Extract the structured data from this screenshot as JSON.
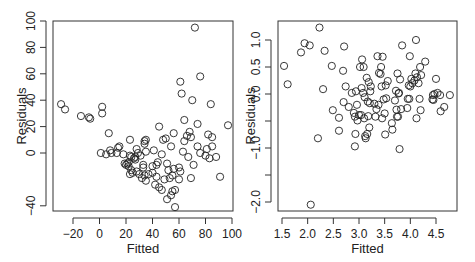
{
  "chart_data": [
    {
      "type": "scatter",
      "title": "",
      "xlabel": "Fitted",
      "ylabel": "Residuals",
      "xlim": [
        -32,
        101
      ],
      "ylim": [
        -45,
        100
      ],
      "xticks": [
        -20,
        0,
        20,
        40,
        60,
        80,
        100
      ],
      "yticks": [
        -40,
        0,
        20,
        40,
        60,
        80,
        100
      ],
      "ytick_labels_shown": [
        "-40",
        "0",
        "20",
        "40",
        "60",
        "80",
        "100"
      ],
      "grid": false,
      "legend": null,
      "points": [
        [
          -29,
          37
        ],
        [
          -26,
          33
        ],
        [
          -14,
          28
        ],
        [
          -8,
          27
        ],
        [
          -7,
          26
        ],
        [
          2,
          35
        ],
        [
          2,
          30
        ],
        [
          7,
          15
        ],
        [
          23,
          10
        ],
        [
          34,
          9
        ],
        [
          35,
          10
        ],
        [
          45,
          20
        ],
        [
          1,
          0
        ],
        [
          5,
          -1
        ],
        [
          8,
          2
        ],
        [
          9,
          0
        ],
        [
          13,
          0
        ],
        [
          14,
          4
        ],
        [
          15,
          5
        ],
        [
          18,
          -1
        ],
        [
          19,
          -8
        ],
        [
          20,
          -9
        ],
        [
          21,
          -8
        ],
        [
          22,
          -7
        ],
        [
          22,
          -10
        ],
        [
          23,
          -16
        ],
        [
          23,
          -2
        ],
        [
          24,
          -3
        ],
        [
          24,
          -13
        ],
        [
          25,
          -15
        ],
        [
          26,
          -4
        ],
        [
          27,
          -5
        ],
        [
          27,
          -3
        ],
        [
          28,
          -14
        ],
        [
          28,
          3
        ],
        [
          29,
          0
        ],
        [
          30,
          -16
        ],
        [
          31,
          -2
        ],
        [
          32,
          -19
        ],
        [
          33,
          -9
        ],
        [
          33,
          -11
        ],
        [
          34,
          -17
        ],
        [
          34,
          7
        ],
        [
          35,
          1
        ],
        [
          35,
          -21
        ],
        [
          37,
          -16
        ],
        [
          40,
          -15
        ],
        [
          40,
          -10
        ],
        [
          41,
          2
        ],
        [
          42,
          -24
        ],
        [
          43,
          -9
        ],
        [
          43,
          -18
        ],
        [
          44,
          -7
        ],
        [
          45,
          -26
        ],
        [
          47,
          -1
        ],
        [
          47,
          -28
        ],
        [
          48,
          10
        ],
        [
          49,
          -20
        ],
        [
          50,
          11
        ],
        [
          51,
          -8
        ],
        [
          51,
          -35
        ],
        [
          52,
          -13
        ],
        [
          53,
          -19
        ],
        [
          54,
          -32
        ],
        [
          54,
          5
        ],
        [
          55,
          -29
        ],
        [
          55,
          -17
        ],
        [
          56,
          15
        ],
        [
          56,
          -12
        ],
        [
          57,
          -28
        ],
        [
          57,
          -41
        ],
        [
          60,
          -11
        ],
        [
          60,
          -20
        ],
        [
          61,
          -14
        ],
        [
          61,
          54
        ],
        [
          62,
          45
        ],
        [
          63,
          1
        ],
        [
          64,
          25
        ],
        [
          64,
          9
        ],
        [
          66,
          13
        ],
        [
          67,
          -3
        ],
        [
          68,
          16
        ],
        [
          69,
          12
        ],
        [
          69,
          -19
        ],
        [
          70,
          40
        ],
        [
          71,
          -9
        ],
        [
          72,
          95
        ],
        [
          74,
          22
        ],
        [
          74,
          5
        ],
        [
          76,
          58
        ],
        [
          76,
          0
        ],
        [
          80,
          -2
        ],
        [
          81,
          3
        ],
        [
          82,
          14
        ],
        [
          83,
          -4
        ],
        [
          84,
          37
        ],
        [
          85,
          12
        ],
        [
          85,
          5
        ],
        [
          88,
          -3
        ],
        [
          91,
          -18
        ],
        [
          97,
          21
        ]
      ]
    },
    {
      "type": "scatter",
      "title": "",
      "xlabel": "Fitted",
      "ylabel": "Residuals",
      "xlim": [
        1.42,
        4.87
      ],
      "ylim": [
        -2.15,
        1.28
      ],
      "xticks": [
        1.5,
        2.0,
        2.5,
        3.0,
        3.5,
        4.0,
        4.5
      ],
      "yticks": [
        -2.0,
        -1.5,
        -1.0,
        -0.5,
        0.0,
        0.5,
        1.0
      ],
      "ytick_labels_shown": [
        "-2.0",
        "-1.0",
        "0.0",
        "0.5",
        "1.0"
      ],
      "grid": false,
      "legend": null,
      "points": [
        [
          1.54,
          0.52
        ],
        [
          1.61,
          0.18
        ],
        [
          1.87,
          0.77
        ],
        [
          1.94,
          0.94
        ],
        [
          2.04,
          0.9
        ],
        [
          2.06,
          -2.05
        ],
        [
          2.2,
          -0.82
        ],
        [
          2.23,
          1.23
        ],
        [
          2.3,
          0.09
        ],
        [
          2.33,
          0.8
        ],
        [
          2.47,
          0.52
        ],
        [
          2.49,
          -0.3
        ],
        [
          2.61,
          -0.44
        ],
        [
          2.61,
          -0.68
        ],
        [
          2.69,
          0.43
        ],
        [
          2.7,
          -0.15
        ],
        [
          2.71,
          0.88
        ],
        [
          2.74,
          0.14
        ],
        [
          2.8,
          -0.24
        ],
        [
          2.86,
          0.02
        ],
        [
          2.9,
          -0.35
        ],
        [
          2.92,
          -0.42
        ],
        [
          2.93,
          -0.74
        ],
        [
          2.94,
          0.05
        ],
        [
          2.92,
          -0.97
        ],
        [
          2.96,
          -0.2
        ],
        [
          2.97,
          -0.49
        ],
        [
          3.0,
          -0.39
        ],
        [
          3.02,
          0.5
        ],
        [
          3.04,
          -0.39
        ],
        [
          3.05,
          0.11
        ],
        [
          3.06,
          0.64
        ],
        [
          3.08,
          0.02
        ],
        [
          3.09,
          0.5
        ],
        [
          3.1,
          -0.45
        ],
        [
          3.11,
          -0.06
        ],
        [
          3.12,
          -0.78
        ],
        [
          3.13,
          -0.82
        ],
        [
          3.15,
          0.3
        ],
        [
          3.16,
          -0.74
        ],
        [
          3.17,
          -0.14
        ],
        [
          3.18,
          -0.41
        ],
        [
          3.19,
          0.22
        ],
        [
          3.2,
          -0.62
        ],
        [
          3.21,
          -0.17
        ],
        [
          3.22,
          0.05
        ],
        [
          3.23,
          0.14
        ],
        [
          3.3,
          -0.18
        ],
        [
          3.32,
          -0.42
        ],
        [
          3.34,
          -0.28
        ],
        [
          3.36,
          0.7
        ],
        [
          3.38,
          -0.2
        ],
        [
          3.39,
          0.39
        ],
        [
          3.42,
          0.37
        ],
        [
          3.43,
          0.5
        ],
        [
          3.44,
          0.14
        ],
        [
          3.45,
          -0.45
        ],
        [
          3.46,
          0.69
        ],
        [
          3.48,
          -0.1
        ],
        [
          3.5,
          -0.36
        ],
        [
          3.51,
          -0.75
        ],
        [
          3.52,
          0.16
        ],
        [
          3.53,
          -0.08
        ],
        [
          3.56,
          0.24
        ],
        [
          3.64,
          -0.54
        ],
        [
          3.65,
          -0.66
        ],
        [
          3.7,
          -0.12
        ],
        [
          3.72,
          0.06
        ],
        [
          3.73,
          -0.29
        ],
        [
          3.74,
          -0.42
        ],
        [
          3.75,
          0.38
        ],
        [
          3.76,
          -0.42
        ],
        [
          3.77,
          0.01
        ],
        [
          3.78,
          0.02
        ],
        [
          3.79,
          -1.02
        ],
        [
          3.8,
          0.27
        ],
        [
          3.82,
          -0.28
        ],
        [
          3.84,
          0.9
        ],
        [
          3.94,
          -0.26
        ],
        [
          3.95,
          -0.09
        ],
        [
          3.97,
          0.16
        ],
        [
          3.98,
          -0.09
        ],
        [
          3.99,
          0.7
        ],
        [
          4.0,
          0.14
        ],
        [
          4.02,
          0.28
        ],
        [
          4.04,
          0.2
        ],
        [
          4.08,
          0.25
        ],
        [
          4.1,
          0.38
        ],
        [
          4.11,
          1.0
        ],
        [
          4.12,
          -0.45
        ],
        [
          4.13,
          0.31
        ],
        [
          4.16,
          0.2
        ],
        [
          4.18,
          -0.09
        ],
        [
          4.19,
          0.5
        ],
        [
          4.2,
          -0.3
        ],
        [
          4.21,
          0.35
        ],
        [
          4.29,
          0.6
        ],
        [
          4.43,
          -0.1
        ],
        [
          4.44,
          -0.02
        ],
        [
          4.45,
          -0.11
        ],
        [
          4.47,
          0.0
        ],
        [
          4.5,
          0.28
        ],
        [
          4.53,
          0.02
        ],
        [
          4.58,
          -0.02
        ],
        [
          4.59,
          -0.32
        ],
        [
          4.66,
          -0.24
        ],
        [
          4.77,
          -0.02
        ]
      ]
    }
  ]
}
